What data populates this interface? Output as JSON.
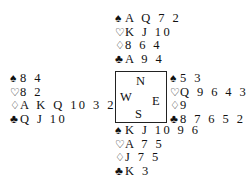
{
  "diagram": {
    "type": "bridge-deal",
    "suit_symbols": {
      "spades": "♠",
      "hearts": "♡",
      "diamonds": "♢",
      "clubs": "♣"
    },
    "compass": {
      "north": "N",
      "west": "W",
      "east": "E",
      "south": "S"
    },
    "hands": {
      "north": {
        "spades": "A Q 7 2",
        "hearts": "K J 10",
        "diamonds": "8 6 4",
        "clubs": "A 9 4"
      },
      "west": {
        "spades": "8 4",
        "hearts": "8 2",
        "diamonds": "A K Q 10 3 2",
        "clubs": "Q J 10"
      },
      "east": {
        "spades": "5 3",
        "hearts": "Q 9 6 4 3",
        "diamonds": "9",
        "clubs": "8 7 6 5 2"
      },
      "south": {
        "spades": "K J 10 9 6",
        "hearts": "A 7 5",
        "diamonds": "J 7 5",
        "clubs": "K 3"
      }
    }
  }
}
